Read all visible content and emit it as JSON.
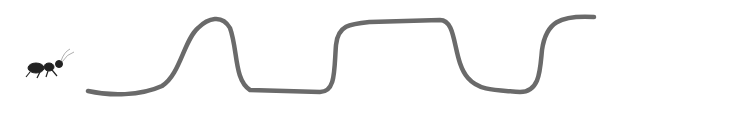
{
  "diagram": {
    "top_row": [
      "0",
      "0",
      "0",
      "0",
      "0",
      "0",
      "0",
      "0",
      "0",
      "0"
    ],
    "bottom_row": [
      "1",
      "1",
      "1",
      "1",
      "1",
      "1",
      "1",
      "1",
      "1",
      "1"
    ],
    "path_bits": [
      "1",
      "1",
      "0",
      "1",
      "1",
      "0",
      "0",
      "1",
      "1",
      "0"
    ],
    "result_label": "1101100110",
    "agent_icon": "ant-icon",
    "colors": {
      "path": "#6a6a6a",
      "box_border": "#555555",
      "text": "#333333"
    }
  }
}
